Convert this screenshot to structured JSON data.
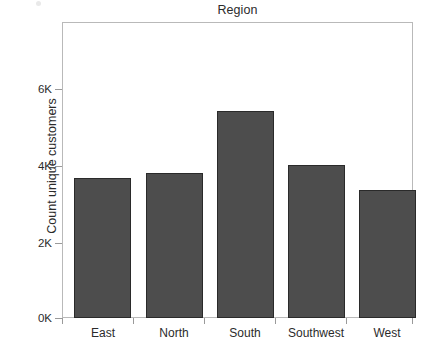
{
  "chart_data": {
    "type": "bar",
    "title": "Region",
    "xlabel": "",
    "ylabel": "Count unique customers",
    "categories": [
      "East",
      "North",
      "South",
      "Southwest",
      "West"
    ],
    "values": [
      3650,
      3870,
      5400,
      4020,
      3350
    ],
    "ylim": [
      0,
      7720
    ],
    "y_ticks": [
      0,
      2000,
      4000,
      6000
    ],
    "y_tick_labels": [
      "0K",
      "2K",
      "4K",
      "6K"
    ],
    "grid": false,
    "legend": null,
    "series": [
      {
        "name": "Count unique customers",
        "values": [
          3650,
          3870,
          5400,
          4020,
          3350
        ]
      }
    ],
    "colors": {
      "bar_fill": "#4d4d4d",
      "bar_border": "#2a2a2a",
      "frame": "#b9b9b9",
      "text": "#2b2b2b",
      "background": "#ffffff"
    }
  },
  "axis": {
    "y_title": "Count unique customers",
    "ticks": [
      {
        "label": "6K",
        "top": 82
      },
      {
        "label": "4K",
        "top": 159
      },
      {
        "label": "2K",
        "top": 236
      },
      {
        "label": "0K",
        "top": 311
      }
    ]
  },
  "bars": [
    {
      "label": "East",
      "value": 3650,
      "left": 12,
      "width": 57,
      "height": 140
    },
    {
      "label": "North",
      "value": 3870,
      "left": 84,
      "width": 57,
      "height": 145
    },
    {
      "label": "South",
      "value": 5400,
      "left": 155,
      "width": 57,
      "height": 207
    },
    {
      "label": "Southwest",
      "value": 4020,
      "left": 226,
      "width": 57,
      "height": 153
    },
    {
      "label": "West",
      "value": 3350,
      "left": 297,
      "width": 57,
      "height": 128
    }
  ],
  "x_ticks": [
    0,
    71,
    142,
    213,
    284,
    350
  ],
  "x_labels": [
    {
      "text": "East",
      "center": 41
    },
    {
      "text": "North",
      "center": 112
    },
    {
      "text": "South",
      "center": 183
    },
    {
      "text": "Southwest",
      "center": 254
    },
    {
      "text": "West",
      "center": 325
    }
  ]
}
